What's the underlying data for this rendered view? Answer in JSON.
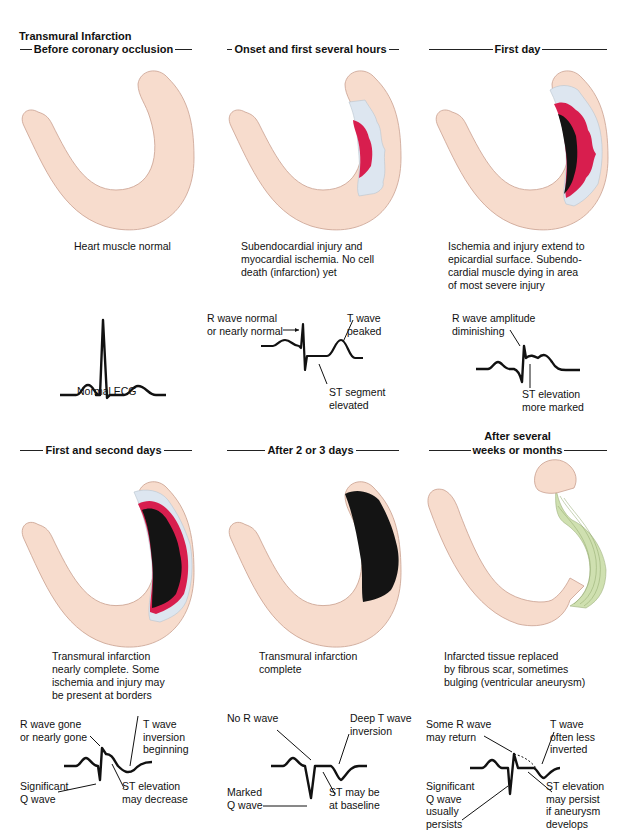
{
  "figure": {
    "title": "Transmural Infarction",
    "colors": {
      "muscle": "#f7dccd",
      "muscle_outline": "#c9a08f",
      "ischemia": "#dde6f0",
      "injury": "#d81e4e",
      "infarction": "#141414",
      "scar": "#cfe0b0",
      "ecg_line": "#111111"
    },
    "panels": [
      {
        "phase": "Before coronary occlusion",
        "caption": "Heart muscle normal",
        "ecg_caption": "Normal ECG",
        "ecg_labels": []
      },
      {
        "phase": "Onset and first several hours",
        "caption": "Subendocardial injury and\nmyocardial ischemia.  No cell\ndeath (infarction) yet",
        "ecg_labels": [
          "R wave normal\nor nearly normal",
          "T wave\npeaked",
          "ST segment\nelevated"
        ]
      },
      {
        "phase": "First day",
        "caption": "Ischemia and injury extend to\nepicardial surface.  Subendo-\ncardial muscle dying in area\nof most severe injury",
        "ecg_labels": [
          "R wave amplitude\ndiminishing",
          "ST elevation\nmore marked"
        ]
      },
      {
        "phase": "First and second days",
        "caption": "Transmural infarction\nnearly complete.  Some\nischemia and injury may\nbe present at borders",
        "ecg_labels": [
          "R wave gone\nor nearly gone",
          "T wave\ninversion\nbeginning",
          "Significant\nQ wave",
          "ST elevation\nmay decrease"
        ]
      },
      {
        "phase": "After 2 or 3 days",
        "caption": "Transmural infarction\ncomplete",
        "ecg_labels": [
          "No R wave",
          "Deep T wave\ninversion",
          "Marked\nQ wave",
          "ST may be\nat baseline"
        ]
      },
      {
        "phase": "After several\nweeks or months",
        "phase_line1": "After several",
        "phase_line2": "weeks or months",
        "caption": "Infarcted tissue replaced\nby fibrous scar, sometimes\nbulging (ventricular aneurysm)",
        "ecg_labels": [
          "Some R wave\nmay return",
          "T wave\noften less\ninverted",
          "Significant\nQ wave\nusually\npersists",
          "ST elevation\nmay persist\nif aneurysm\ndevelops"
        ]
      }
    ]
  }
}
